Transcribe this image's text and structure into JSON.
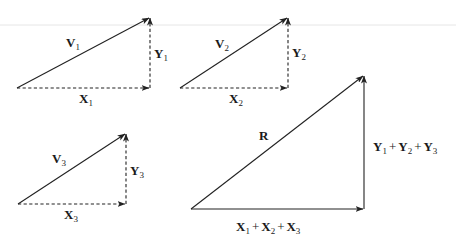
{
  "diagram": {
    "component_vectors": [
      {
        "vector": "V",
        "index": "1",
        "x_component": "X",
        "y_component": "Y"
      },
      {
        "vector": "V",
        "index": "2",
        "x_component": "X",
        "y_component": "Y"
      },
      {
        "vector": "V",
        "index": "3",
        "x_component": "X",
        "y_component": "Y"
      }
    ],
    "resultant": {
      "label": "R",
      "x_sum": {
        "parts": [
          "X",
          "X",
          "X"
        ],
        "indices": [
          "1",
          "2",
          "3"
        ],
        "operator": "+"
      },
      "y_sum": {
        "parts": [
          "Y",
          "Y",
          "Y"
        ],
        "indices": [
          "1",
          "2",
          "3"
        ],
        "operator": "+"
      }
    },
    "colors": {
      "stroke": "#222222",
      "text": "#1a1a1a",
      "background": "#ffffff"
    }
  }
}
